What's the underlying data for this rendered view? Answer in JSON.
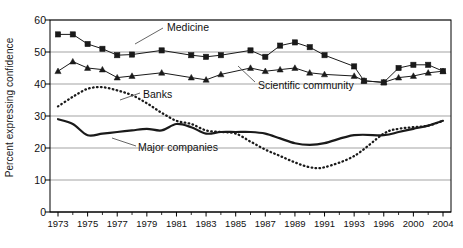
{
  "chart_data": {
    "type": "line",
    "title": "",
    "xlabel": "",
    "ylabel": "Percent expressing confidence",
    "ylim": [
      0,
      60
    ],
    "yticks": [
      0,
      10,
      20,
      30,
      40,
      50,
      60
    ],
    "grid": true,
    "legend_position": "inline-annotations",
    "x_tick_labels": [
      "1973",
      "1975",
      "1977",
      "1979",
      "1981",
      "1983",
      "1985",
      "1987",
      "1989",
      "1991",
      "1993",
      "1996",
      "2000",
      "2004"
    ],
    "x_tick_years": [
      1973,
      1975,
      1977,
      1979,
      1981,
      1983,
      1985,
      1987,
      1989,
      1991,
      1993,
      1996,
      2000,
      2004
    ],
    "x_all_years": [
      1973,
      1974,
      1975,
      1976,
      1977,
      1978,
      1979,
      1980,
      1981,
      1982,
      1983,
      1984,
      1985,
      1986,
      1987,
      1988,
      1989,
      1990,
      1991,
      1993,
      1996,
      1998,
      2000,
      2002,
      2004
    ],
    "annotations": [
      {
        "text": "Medicine",
        "series": "Medicine"
      },
      {
        "text": "Scientific community",
        "series": "Scientific community"
      },
      {
        "text": "Banks",
        "series": "Banks"
      },
      {
        "text": "Major companies",
        "series": "Major companies"
      }
    ],
    "series": [
      {
        "name": "Medicine",
        "marker": "square",
        "style": "solid",
        "x": [
          1973,
          1974,
          1975,
          1976,
          1977,
          1978,
          1980,
          1982,
          1983,
          1984,
          1986,
          1987,
          1988,
          1989,
          1990,
          1991,
          1993,
          1994,
          1996,
          1998,
          2000,
          2002,
          2004
        ],
        "values": [
          55.5,
          55.5,
          52.5,
          51,
          49,
          49.2,
          50.5,
          49,
          48.5,
          49,
          50.5,
          48.5,
          52,
          53,
          51.5,
          49,
          45.5,
          41,
          40.5,
          45,
          46,
          46,
          44
        ]
      },
      {
        "name": "Scientific community",
        "marker": "triangle",
        "style": "solid",
        "x": [
          1973,
          1974,
          1975,
          1976,
          1977,
          1978,
          1980,
          1982,
          1983,
          1984,
          1986,
          1987,
          1988,
          1989,
          1990,
          1991,
          1993,
          1994,
          1996,
          1998,
          2000,
          2002,
          2004
        ],
        "values": [
          44,
          47,
          45,
          44.5,
          42,
          42.5,
          43.5,
          42,
          41.3,
          43,
          45,
          44,
          44.5,
          45,
          43.5,
          43,
          42.5,
          41,
          40.5,
          42,
          42.5,
          43.5,
          44
        ]
      },
      {
        "name": "Banks",
        "marker": "none",
        "style": "dotted",
        "x": [
          1973,
          1974,
          1975,
          1976,
          1977,
          1978,
          1979,
          1980,
          1981,
          1982,
          1983,
          1984,
          1985,
          1986,
          1987,
          1988,
          1989,
          1990,
          1991,
          1993,
          1996,
          1998,
          2000,
          2002,
          2004
        ],
        "values": [
          33,
          36,
          38.5,
          39,
          38,
          36.5,
          34,
          31,
          28.5,
          27.5,
          25.5,
          25,
          24.5,
          22,
          19.5,
          17.5,
          15.5,
          14,
          14,
          17.5,
          24.5,
          26,
          26.5,
          27,
          28.5
        ]
      },
      {
        "name": "Major companies",
        "marker": "none",
        "style": "solid-thick",
        "x": [
          1973,
          1974,
          1975,
          1976,
          1977,
          1978,
          1979,
          1980,
          1981,
          1982,
          1983,
          1984,
          1985,
          1986,
          1987,
          1988,
          1989,
          1990,
          1991,
          1993,
          1996,
          1998,
          2000,
          2002,
          2004
        ],
        "values": [
          29,
          27.5,
          24,
          24.5,
          25,
          25.5,
          26,
          25.5,
          27.5,
          26.5,
          24.5,
          25,
          25,
          25,
          24.5,
          23,
          21.5,
          21,
          21.5,
          24,
          24,
          25,
          26,
          27,
          28.5
        ]
      }
    ],
    "colors": {
      "axis": "#000000",
      "grid": "#999999",
      "line": "#1a1a1a",
      "background": "#ffffff"
    }
  }
}
